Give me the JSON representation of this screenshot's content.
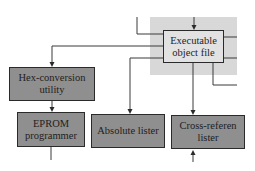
{
  "diagram": {
    "type": "flowchart",
    "nodes": [
      {
        "id": "exec",
        "label_line1": "Executable",
        "label_line2": "object file",
        "highlighted": true
      },
      {
        "id": "hex",
        "label_line1": "Hex-conversion",
        "label_line2": "utility"
      },
      {
        "id": "eprom",
        "label_line1": "EPROM",
        "label_line2": "programmer"
      },
      {
        "id": "abs",
        "label_line1": "Absolute lister"
      },
      {
        "id": "xref",
        "label_line1": "Cross-referen",
        "label_line2": "lister"
      }
    ],
    "edges": [
      {
        "from": "above",
        "to": "exec"
      },
      {
        "from": "exec",
        "to": "hex"
      },
      {
        "from": "exec",
        "to": "abs"
      },
      {
        "from": "exec",
        "to": "xref"
      },
      {
        "from": "hex",
        "to": "eprom"
      }
    ],
    "colors": {
      "node_fill": "#8f8f8f",
      "highlight_node_fill": "#e2e2e2",
      "highlight_region": "#d8d8d8",
      "stroke": "#2a2a2a"
    }
  }
}
